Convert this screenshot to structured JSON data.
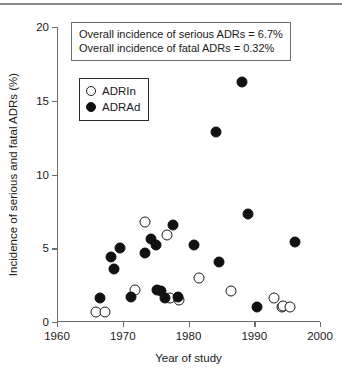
{
  "chart_data": {
    "type": "scatter",
    "title": "",
    "xlabel": "Year of study",
    "ylabel": "Incidence of serious and fatal ADRs (%)",
    "xlim": [
      1960,
      2000
    ],
    "ylim": [
      0,
      20
    ],
    "xticks": [
      1960,
      1970,
      1980,
      1990,
      2000
    ],
    "yticks": [
      0,
      5,
      10,
      15,
      20
    ],
    "grid": false,
    "legend_position": "upper-left-inside",
    "annotations": [
      "Overall incidence of serious ADRs = 6.7%",
      "Overall incidence of fatal ADRs = 0.32%"
    ],
    "series": [
      {
        "name": "ADRIn",
        "marker": "open-circle",
        "color": "#ffffff",
        "edge_color": "#1a1a1a",
        "points": [
          {
            "x": 1966.0,
            "y": 0.7
          },
          {
            "x": 1967.3,
            "y": 0.7
          },
          {
            "x": 1971.8,
            "y": 2.2
          },
          {
            "x": 1973.4,
            "y": 6.8
          },
          {
            "x": 1976.8,
            "y": 5.9
          },
          {
            "x": 1977.2,
            "y": 1.6
          },
          {
            "x": 1978.6,
            "y": 1.5
          },
          {
            "x": 1981.6,
            "y": 3.0
          },
          {
            "x": 1986.4,
            "y": 2.1
          },
          {
            "x": 1993.0,
            "y": 1.6
          },
          {
            "x": 1994.2,
            "y": 1.0
          },
          {
            "x": 1994.4,
            "y": 1.1
          },
          {
            "x": 1995.4,
            "y": 1.0
          }
        ]
      },
      {
        "name": "ADRAd",
        "marker": "filled-circle",
        "color": "#111111",
        "edge_color": "#111111",
        "points": [
          {
            "x": 1966.6,
            "y": 1.6
          },
          {
            "x": 1968.2,
            "y": 4.4
          },
          {
            "x": 1968.6,
            "y": 3.6
          },
          {
            "x": 1969.6,
            "y": 5.0
          },
          {
            "x": 1971.3,
            "y": 1.7
          },
          {
            "x": 1973.4,
            "y": 4.7
          },
          {
            "x": 1974.3,
            "y": 5.6
          },
          {
            "x": 1975.0,
            "y": 5.2
          },
          {
            "x": 1975.2,
            "y": 2.2
          },
          {
            "x": 1975.8,
            "y": 2.1
          },
          {
            "x": 1976.4,
            "y": 1.6
          },
          {
            "x": 1977.6,
            "y": 6.6
          },
          {
            "x": 1978.4,
            "y": 1.7
          },
          {
            "x": 1980.8,
            "y": 5.2
          },
          {
            "x": 1984.2,
            "y": 12.9
          },
          {
            "x": 1984.6,
            "y": 4.1
          },
          {
            "x": 1988.2,
            "y": 16.3
          },
          {
            "x": 1989.0,
            "y": 7.3
          },
          {
            "x": 1990.4,
            "y": 1.0
          },
          {
            "x": 1996.2,
            "y": 5.4
          }
        ]
      }
    ]
  },
  "axes": {
    "y_title": "Incidence of serious and fatal ADRs (%)",
    "x_title": "Year of study",
    "y_ticks": [
      "20",
      "15",
      "10",
      "5",
      "0"
    ],
    "x_ticks": [
      "1960",
      "1970",
      "1980",
      "1990",
      "2000"
    ]
  },
  "annotation": {
    "line1": "Overall incidence of serious ADRs = 6.7%",
    "line2": "Overall incidence of fatal ADRs = 0.32%"
  },
  "legend": {
    "items": [
      {
        "label": "ADRIn",
        "marker": "open"
      },
      {
        "label": "ADRAd",
        "marker": "filled"
      }
    ]
  }
}
